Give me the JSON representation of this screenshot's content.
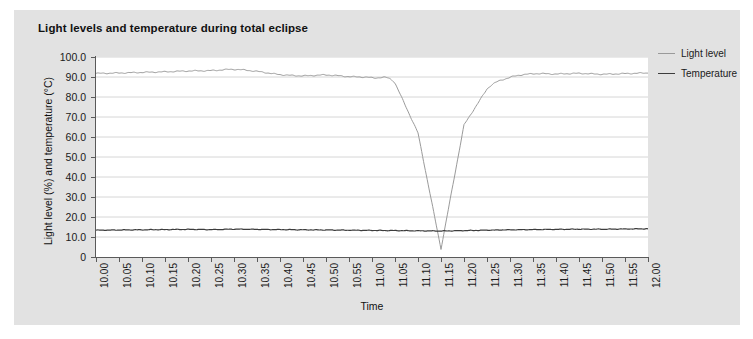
{
  "chart_data": {
    "type": "line",
    "title": "Light levels and temperature during total eclipse",
    "xlabel": "Time",
    "ylabel": "Light level (%) and temperature (°C)",
    "ylim": [
      0,
      100
    ],
    "ytick_labels": [
      "100.0",
      "90.0",
      "80.0",
      "70.0",
      "60.0",
      "50.0",
      "40.0",
      "30.0",
      "20.0",
      "10.0",
      "0"
    ],
    "ytick_values": [
      100,
      90,
      80,
      70,
      60,
      50,
      40,
      30,
      20,
      10,
      0
    ],
    "grid": "horizontal",
    "legend_position": "right",
    "x": [
      "10.00",
      "10.05",
      "10.10",
      "10.15",
      "10.20",
      "10.25",
      "10.30",
      "10.35",
      "10.40",
      "10.45",
      "10.50",
      "10.55",
      "11.00",
      "11.05",
      "11.10",
      "11.15",
      "11.20",
      "11.25",
      "11.30",
      "11.35",
      "11.40",
      "11.45",
      "11.50",
      "11.55",
      "12.00"
    ],
    "series": [
      {
        "name": "Light level",
        "color": "#9a9a9a",
        "values": [
          91.8,
          92.0,
          92.3,
          92.6,
          93.0,
          93.2,
          93.8,
          92.8,
          91.2,
          90.6,
          91.0,
          90.2,
          89.6,
          87.0,
          62.0,
          4.0,
          66.0,
          84.0,
          89.8,
          91.6,
          91.5,
          91.8,
          91.4,
          91.7,
          92.0
        ]
      },
      {
        "name": "Temperature",
        "color": "#3c3c3c",
        "values": [
          13.4,
          13.5,
          13.6,
          13.7,
          13.8,
          13.7,
          13.9,
          13.8,
          13.7,
          13.6,
          13.5,
          13.4,
          13.3,
          13.2,
          13.1,
          13.0,
          13.2,
          13.4,
          13.6,
          13.7,
          13.8,
          13.9,
          13.9,
          14.0,
          14.1
        ]
      }
    ],
    "annotations": {
      "eclipse_totality_time": "11.13",
      "eclipse_minimum_light_pct": 4.0
    }
  },
  "legend": {
    "items": [
      {
        "label": "Light level",
        "color": "#9a9a9a"
      },
      {
        "label": "Temperature",
        "color": "#3c3c3c"
      }
    ]
  }
}
